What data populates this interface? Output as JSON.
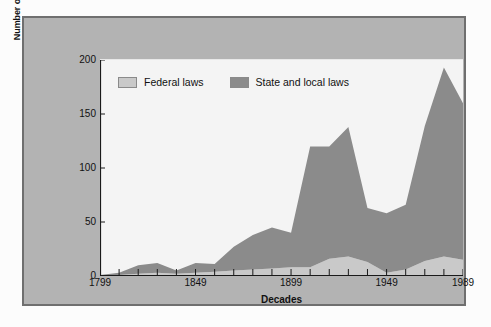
{
  "chart_data": {
    "type": "area",
    "title": "",
    "subtitle": "",
    "xlabel": "Decades",
    "ylabel": "Number of laws ruled unconstitutional",
    "ylim": [
      0,
      200
    ],
    "yticks": [
      0,
      50,
      100,
      150,
      200
    ],
    "xlim": [
      1799,
      1989
    ],
    "xticklabels": [
      "1799",
      "1849",
      "1899",
      "1949",
      "1989"
    ],
    "xtickvalues": [
      1799,
      1849,
      1899,
      1949,
      1989
    ],
    "minor_tick_count": 20,
    "grid": false,
    "stacked": true,
    "legend_position": "top-left",
    "x": [
      1799,
      1809,
      1819,
      1829,
      1839,
      1849,
      1859,
      1869,
      1879,
      1889,
      1899,
      1909,
      1919,
      1929,
      1939,
      1949,
      1959,
      1969,
      1979,
      1989
    ],
    "categories": [
      "1799",
      "1809",
      "1819",
      "1829",
      "1839",
      "1849",
      "1859",
      "1869",
      "1879",
      "1889",
      "1899",
      "1909",
      "1919",
      "1929",
      "1939",
      "1949",
      "1959",
      "1969",
      "1979",
      "1989"
    ],
    "series": [
      {
        "name": "Federal laws",
        "color": "#c9c9c9",
        "values": [
          1,
          1,
          2,
          3,
          2,
          3,
          4,
          5,
          6,
          7,
          8,
          8,
          16,
          18,
          13,
          3,
          6,
          14,
          18,
          15
        ]
      },
      {
        "name": "State and local laws",
        "color": "#8b8b8b",
        "values": [
          0,
          2,
          8,
          9,
          3,
          9,
          7,
          22,
          32,
          38,
          32,
          112,
          104,
          120,
          50,
          55,
          60,
          125,
          175,
          145
        ]
      }
    ],
    "totals": [
      1,
      3,
      10,
      12,
      5,
      12,
      11,
      27,
      38,
      45,
      40,
      120,
      120,
      138,
      63,
      58,
      66,
      139,
      193,
      160
    ]
  },
  "legend": {
    "items": [
      {
        "label": "Federal laws",
        "color": "#c9c9c9"
      },
      {
        "label": "State and local laws",
        "color": "#8b8b8b"
      }
    ]
  },
  "axes": {
    "y_title": "Number of laws ruled unconstitutional",
    "x_title": "Decades"
  },
  "colors": {
    "panel_background": "#b3b3b3",
    "panel_border": "#6f6f6f",
    "plot_background": "#f4f4f4",
    "federal": "#c9c9c9",
    "state_local": "#8b8b8b",
    "axis": "#1a1a1a"
  }
}
